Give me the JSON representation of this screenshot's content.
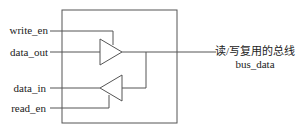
{
  "diagram": {
    "type": "tri-state bidirectional bus buffer",
    "signals": {
      "write_en": "write_en",
      "data_out": "data_out",
      "data_in": "data_in",
      "read_en": "read_en"
    },
    "bus": {
      "description": "读/写复用的总线",
      "name": "bus_data"
    },
    "colors": {
      "line": "#555555",
      "text": "#222222",
      "background": "#ffffff"
    }
  }
}
